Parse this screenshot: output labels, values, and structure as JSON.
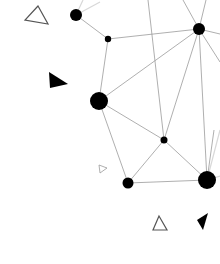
{
  "diagram": {
    "type": "network-graph-decoration",
    "background": "#ffffff",
    "node_color": "#000000",
    "edge_color": "#9a9a9a",
    "nodes": [
      {
        "id": "A",
        "x": 76,
        "y": 15,
        "r": 6
      },
      {
        "id": "B",
        "x": 108,
        "y": 39,
        "r": 3.2
      },
      {
        "id": "C",
        "x": 199,
        "y": 29,
        "r": 6
      },
      {
        "id": "D",
        "x": 99,
        "y": 101,
        "r": 9
      },
      {
        "id": "E",
        "x": 164,
        "y": 140,
        "r": 3.5
      },
      {
        "id": "F",
        "x": 128,
        "y": 183,
        "r": 5.5
      },
      {
        "id": "G",
        "x": 207,
        "y": 180,
        "r": 9
      }
    ],
    "edges": [
      [
        "A",
        "B"
      ],
      [
        "B",
        "C"
      ],
      [
        "B",
        "D"
      ],
      [
        "C",
        "D"
      ],
      [
        "C",
        "F"
      ],
      [
        "C",
        "G"
      ],
      [
        "D",
        "E"
      ],
      [
        "D",
        "F"
      ],
      [
        "E",
        "F"
      ],
      [
        "E",
        "G"
      ],
      [
        "F",
        "G"
      ]
    ],
    "shapes": [
      {
        "kind": "triangle-outline",
        "label": "outline-triangle-top-left"
      },
      {
        "kind": "triangle-solid",
        "label": "solid-triangle-left"
      },
      {
        "kind": "triangle-outline-small",
        "label": "small-outline-triangle"
      },
      {
        "kind": "triangle-outline",
        "label": "outline-triangle-bottom"
      },
      {
        "kind": "triangle-solid",
        "label": "solid-triangle-bottom-right"
      }
    ]
  }
}
